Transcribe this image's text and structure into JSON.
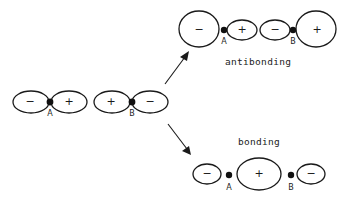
{
  "diagram": {
    "type": "molecular-orbital-combination",
    "left_molecule": {
      "orbitals": [
        {
          "lobes": [
            {
              "sign": "−"
            },
            {
              "sign": "+"
            }
          ],
          "atom": "A"
        },
        {
          "lobes": [
            {
              "sign": "+"
            },
            {
              "sign": "−"
            }
          ],
          "atom": "B"
        }
      ]
    },
    "antibonding": {
      "caption": "antibonding",
      "lobes": [
        {
          "sign": "−"
        },
        {
          "sign": "+"
        },
        {
          "sign": "−"
        },
        {
          "sign": "+"
        }
      ],
      "atoms": [
        "A",
        "B"
      ]
    },
    "bonding": {
      "caption": "bonding",
      "lobes": [
        {
          "sign": "−"
        },
        {
          "sign": "+"
        },
        {
          "sign": "−"
        }
      ],
      "atoms": [
        "A",
        "B"
      ]
    },
    "arrows": [
      {
        "name": "to-antibonding",
        "direction": "up-right"
      },
      {
        "name": "to-bonding",
        "direction": "down-right"
      }
    ]
  }
}
